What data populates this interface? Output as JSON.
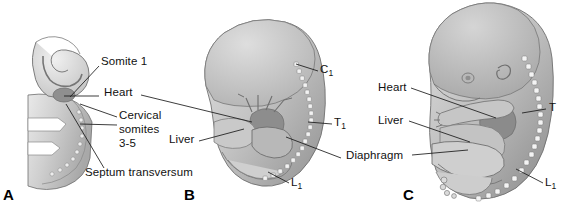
{
  "figure": {
    "background_color": "#ffffff",
    "line_color": "#1a1a1a",
    "tissue_colors": {
      "body_light": "#d6d6d6",
      "body_mid": "#bcbcbc",
      "body_dark": "#9a9a9a",
      "organ_dark": "#8a8a8a",
      "highlight": "#e8e8e8",
      "outline": "#5a5a5a"
    }
  },
  "panels": [
    {
      "id": "A",
      "letter": "A",
      "caption_stage": "early embryo, cervical level",
      "labels": [
        {
          "name": "somite-1",
          "text": "Somite 1"
        },
        {
          "name": "heart",
          "text": "Heart"
        },
        {
          "name": "cervical-somites",
          "text": "Cervical somites 3-5",
          "lines": [
            "Cervical",
            "somites",
            "3-5"
          ]
        },
        {
          "name": "septum-transversum",
          "text": "Septum transversum"
        }
      ]
    },
    {
      "id": "B",
      "letter": "B",
      "caption_stage": "intermediate embryo",
      "labels": [
        {
          "name": "c1-vertebra",
          "text": "C",
          "subscript": "1"
        },
        {
          "name": "t1-vertebra",
          "text": "T",
          "subscript": "1"
        },
        {
          "name": "l1-vertebra",
          "text": "L",
          "subscript": "1"
        },
        {
          "name": "liver",
          "text": "Liver"
        }
      ]
    },
    {
      "id": "C",
      "letter": "C",
      "caption_stage": "later fetus",
      "labels": [
        {
          "name": "heart",
          "text": "Heart"
        },
        {
          "name": "liver",
          "text": "Liver"
        },
        {
          "name": "diaphragm",
          "text": "Diaphragm"
        },
        {
          "name": "t-vertebra",
          "text": "T"
        },
        {
          "name": "l1-vertebra",
          "text": "L",
          "subscript": "1"
        }
      ]
    }
  ],
  "text": {
    "somite_1": "Somite 1",
    "heart": "Heart",
    "cervical_line1": "Cervical",
    "cervical_line2": "somites",
    "cervical_line3": "3-5",
    "septum_transversum": "Septum transversum",
    "liver": "Liver",
    "diaphragm": "Diaphragm",
    "c_letter": "C",
    "t_letter": "T",
    "l_letter": "L",
    "sub_one": "1",
    "panel_a": "A",
    "panel_b": "B",
    "panel_c": "C",
    "heart_c": "Heart",
    "liver_c": "Liver",
    "t_plain": "T"
  }
}
